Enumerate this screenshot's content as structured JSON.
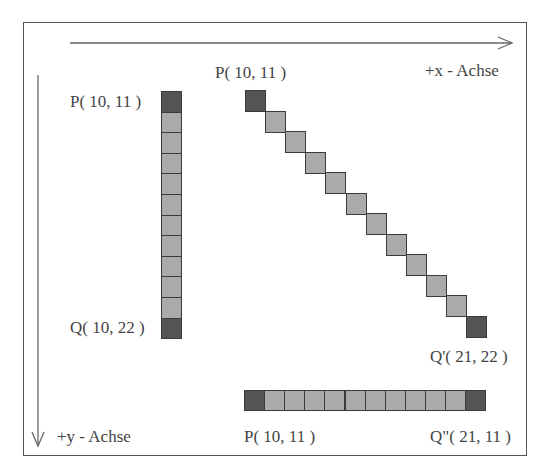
{
  "colors": {
    "endpoint": "#555555",
    "pixel": "#aaaaaa",
    "border": "#3a3a3a",
    "axis": "#666666",
    "text": "#444444"
  },
  "axes": {
    "x_label": "+x - Achse",
    "y_label": "+y - Achse"
  },
  "vertical_line": {
    "start_label": "P( 10, 11 )",
    "end_label": "Q( 10, 22 )",
    "start": [
      10,
      11
    ],
    "end": [
      10,
      22
    ],
    "pixel_count": 12
  },
  "diagonal_line": {
    "start_label": "P( 10, 11 )",
    "end_label": "Q'( 21, 22 )",
    "start": [
      10,
      11
    ],
    "end": [
      21,
      22
    ],
    "pixel_count": 12
  },
  "horizontal_line": {
    "start_label": "P( 10, 11 )",
    "end_label": "Q\"( 21, 11 )",
    "start": [
      10,
      11
    ],
    "end": [
      21,
      11
    ],
    "pixel_count": 12
  }
}
